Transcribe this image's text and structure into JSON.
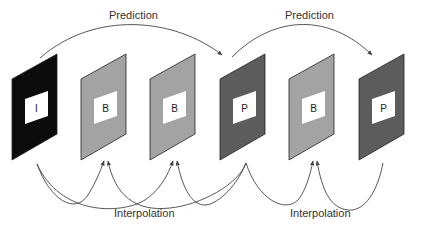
{
  "diagram": {
    "labels": {
      "prediction_1": "Prediction",
      "prediction_2": "Prediction",
      "interpolation_1": "Interpolation",
      "interpolation_2": "Interpolation"
    },
    "frames": [
      {
        "type": "I",
        "letter": "I",
        "color": "#0b0b0b"
      },
      {
        "type": "B",
        "letter": "B",
        "color": "#a3a3a3"
      },
      {
        "type": "B",
        "letter": "B",
        "color": "#a3a3a3"
      },
      {
        "type": "P",
        "letter": "P",
        "color": "#5c5c5c"
      },
      {
        "type": "B",
        "letter": "B",
        "color": "#a3a3a3"
      },
      {
        "type": "P",
        "letter": "P",
        "color": "#5c5c5c"
      }
    ],
    "colors": {
      "background": "#ffffff",
      "arrow": "#444444",
      "frame_border": "#222222",
      "inner_box": "#ffffff"
    }
  }
}
